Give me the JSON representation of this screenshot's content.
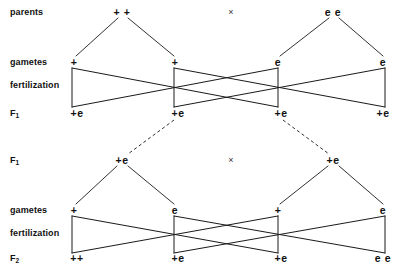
{
  "diagram": {
    "width": 398,
    "height": 273,
    "line_color": "#1a1a1a",
    "text_color": "#111111",
    "background": "#ffffff"
  },
  "row_labels": {
    "parents": "parents",
    "gametes_1": "gametes",
    "fertilization_1": "fertilization",
    "f1_result": "F",
    "f1_result_sub": "1",
    "f1_parents": "F",
    "f1_parents_sub": "1",
    "gametes_2": "gametes",
    "fertilization_2": "fertilization",
    "f2_result": "F",
    "f2_result_sub": "2"
  },
  "cross_symbol": "×",
  "generations": {
    "parents": {
      "label": "parents",
      "genotypes": [
        {
          "text": "+ +",
          "x": 122,
          "y": 12
        },
        {
          "text": "e e",
          "x": 333,
          "y": 12
        }
      ],
      "cross": {
        "text": "×",
        "x": 231,
        "y": 12
      }
    },
    "gametes_1": {
      "label": "gametes",
      "alleles": [
        {
          "text": "+",
          "x": 74,
          "y": 62
        },
        {
          "text": "+",
          "x": 175,
          "y": 62
        },
        {
          "text": "e",
          "x": 278,
          "y": 62
        },
        {
          "text": "e",
          "x": 383,
          "y": 62
        }
      ]
    },
    "f1_offspring": {
      "label": "F1",
      "genotypes": [
        {
          "text": "+e",
          "x": 77,
          "y": 113
        },
        {
          "text": "+e",
          "x": 178,
          "y": 113
        },
        {
          "text": "+e",
          "x": 281,
          "y": 113
        },
        {
          "text": "+e",
          "x": 383,
          "y": 113
        }
      ]
    },
    "f1_parents": {
      "label": "F1",
      "genotypes": [
        {
          "text": "+e",
          "x": 122,
          "y": 160
        },
        {
          "text": "+e",
          "x": 333,
          "y": 160
        }
      ],
      "cross": {
        "text": "×",
        "x": 231,
        "y": 160
      }
    },
    "gametes_2": {
      "label": "gametes",
      "alleles": [
        {
          "text": "+",
          "x": 74,
          "y": 210
        },
        {
          "text": "e",
          "x": 175,
          "y": 210
        },
        {
          "text": "+",
          "x": 278,
          "y": 210
        },
        {
          "text": "e",
          "x": 383,
          "y": 210
        }
      ]
    },
    "f2_offspring": {
      "label": "F2",
      "genotypes": [
        {
          "text": "++",
          "x": 77,
          "y": 258
        },
        {
          "text": "+e",
          "x": 178,
          "y": 258
        },
        {
          "text": "+e",
          "x": 281,
          "y": 258
        },
        {
          "text": "e e",
          "x": 383,
          "y": 258
        }
      ],
      "ratio": "1 : 2 : 1"
    }
  },
  "label_positions": {
    "parents": {
      "x": 10,
      "y": 7
    },
    "gametes_1": {
      "x": 10,
      "y": 57
    },
    "fertilization_1": {
      "x": 10,
      "y": 80
    },
    "f1_result": {
      "x": 10,
      "y": 108
    },
    "f1_parents": {
      "x": 10,
      "y": 155
    },
    "gametes_2": {
      "x": 10,
      "y": 205
    },
    "fertilization_2": {
      "x": 10,
      "y": 228
    },
    "f2_result": {
      "x": 10,
      "y": 253
    }
  },
  "meiosis_lines": {
    "comment": "parent -> gamete descent lines",
    "segments": [
      {
        "x1": 118,
        "y1": 18,
        "x2": 76,
        "y2": 56
      },
      {
        "x1": 128,
        "y1": 18,
        "x2": 174,
        "y2": 56
      },
      {
        "x1": 329,
        "y1": 18,
        "x2": 280,
        "y2": 56
      },
      {
        "x1": 339,
        "y1": 18,
        "x2": 383,
        "y2": 56
      },
      {
        "x1": 117,
        "y1": 166,
        "x2": 76,
        "y2": 204
      },
      {
        "x1": 128,
        "y1": 166,
        "x2": 174,
        "y2": 204
      },
      {
        "x1": 328,
        "y1": 166,
        "x2": 280,
        "y2": 204
      },
      {
        "x1": 339,
        "y1": 166,
        "x2": 383,
        "y2": 204
      }
    ]
  },
  "fertilization_lines": {
    "comment": "gamete -> zygote fusion lines for block 1",
    "block1": [
      {
        "x1": 72,
        "y1": 68,
        "x2": 72,
        "y2": 107
      },
      {
        "x1": 174,
        "y1": 68,
        "x2": 174,
        "y2": 107
      },
      {
        "x1": 278,
        "y1": 68,
        "x2": 278,
        "y2": 107
      },
      {
        "x1": 385,
        "y1": 68,
        "x2": 385,
        "y2": 107
      },
      {
        "x1": 72,
        "y1": 68,
        "x2": 278,
        "y2": 107
      },
      {
        "x1": 174,
        "y1": 68,
        "x2": 385,
        "y2": 107
      },
      {
        "x1": 278,
        "y1": 68,
        "x2": 72,
        "y2": 107
      },
      {
        "x1": 385,
        "y1": 68,
        "x2": 174,
        "y2": 107
      }
    ],
    "block2": [
      {
        "x1": 72,
        "y1": 216,
        "x2": 72,
        "y2": 253
      },
      {
        "x1": 174,
        "y1": 216,
        "x2": 174,
        "y2": 253
      },
      {
        "x1": 278,
        "y1": 216,
        "x2": 278,
        "y2": 253
      },
      {
        "x1": 385,
        "y1": 216,
        "x2": 385,
        "y2": 253
      },
      {
        "x1": 72,
        "y1": 216,
        "x2": 278,
        "y2": 253
      },
      {
        "x1": 174,
        "y1": 216,
        "x2": 385,
        "y2": 253
      },
      {
        "x1": 278,
        "y1": 216,
        "x2": 72,
        "y2": 253
      },
      {
        "x1": 385,
        "y1": 216,
        "x2": 174,
        "y2": 253
      }
    ]
  },
  "selection_lines": {
    "comment": "dashed lines selecting F1 individuals for the second cross",
    "segments": [
      {
        "x1": 174,
        "y1": 120,
        "x2": 128,
        "y2": 154
      },
      {
        "x1": 283,
        "y1": 120,
        "x2": 329,
        "y2": 154
      }
    ]
  }
}
